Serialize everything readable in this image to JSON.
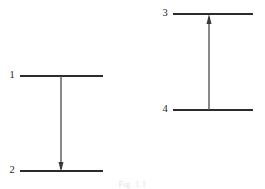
{
  "figure": {
    "type": "energy-level-transition-diagram",
    "background_color": "#ffffff",
    "line_color": "#2b2b2b",
    "arrow_color": "#3a3a3a",
    "label_color": "#1e1e1e",
    "caption": "Fig. 1.1",
    "caption_color": "#e2e2e2",
    "width": 265,
    "height": 189
  },
  "diagrams": [
    {
      "id": "left-diagram",
      "name": "downward-transition",
      "transition_direction": "down",
      "levels": [
        {
          "label": "1",
          "role": "upper-level",
          "label_x": 12,
          "label_y": 76,
          "line_x1": 20,
          "line_x2": 103,
          "line_y": 76
        },
        {
          "label": "2",
          "role": "lower-level",
          "label_x": 12,
          "label_y": 171,
          "line_x1": 20,
          "line_x2": 103,
          "line_y": 171
        }
      ],
      "arrow": {
        "x": 61,
        "y_start": 76,
        "y_end": 171,
        "head_at": "end",
        "head_half_width": 2.6,
        "head_length": 9
      }
    },
    {
      "id": "right-diagram",
      "name": "upward-transition",
      "transition_direction": "up",
      "levels": [
        {
          "label": "3",
          "role": "upper-level",
          "label_x": 165,
          "label_y": 14,
          "line_x1": 173,
          "line_x2": 253,
          "line_y": 14
        },
        {
          "label": "4",
          "role": "lower-level",
          "label_x": 165,
          "label_y": 110,
          "line_x1": 173,
          "line_x2": 253,
          "line_y": 110
        }
      ],
      "arrow": {
        "x": 209,
        "y_start": 110,
        "y_end": 15,
        "head_at": "end",
        "head_half_width": 2.6,
        "head_length": 9
      }
    }
  ],
  "labels": {
    "level_1": "1",
    "level_2": "2",
    "level_3": "3",
    "level_4": "4"
  }
}
